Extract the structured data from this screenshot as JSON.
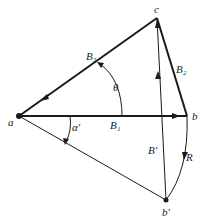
{
  "diagram": {
    "points": {
      "a": {
        "label": "a",
        "x": 19,
        "y": 116
      },
      "b": {
        "label": "b",
        "x": 187,
        "y": 116
      },
      "c": {
        "label": "c",
        "x": 157,
        "y": 18
      },
      "b_prime": {
        "label": "b′",
        "x": 166,
        "y": 200
      }
    },
    "edges": {
      "B1": {
        "label": "B₁",
        "from": "a",
        "to": "b"
      },
      "B2": {
        "label": "B₂",
        "from": "b",
        "to": "c"
      },
      "B3": {
        "label": "B₃",
        "from": "c",
        "to": "a"
      },
      "B_prime": {
        "label": "B′",
        "from": "b_prime",
        "to": "c"
      },
      "a_bprime": {
        "label": "",
        "from": "a",
        "to": "b_prime"
      }
    },
    "arcs": {
      "theta": {
        "label": "θ"
      },
      "alpha_prime": {
        "label": "α′"
      },
      "R": {
        "label": "R"
      }
    },
    "colors": {
      "stroke": "#1a1a1a",
      "background": "#ffffff"
    }
  }
}
